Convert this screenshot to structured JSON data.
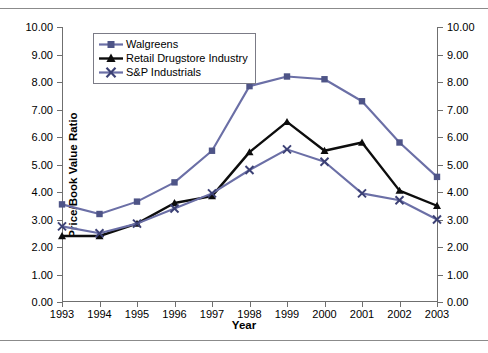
{
  "chart_data": {
    "type": "line",
    "title": "",
    "xlabel": "Year",
    "ylabel": "Price/Book Value Ratio",
    "categories": [
      "1993",
      "1994",
      "1995",
      "1996",
      "1997",
      "1998",
      "1999",
      "2000",
      "2001",
      "2002",
      "2003"
    ],
    "x": [
      1993,
      1994,
      1995,
      1996,
      1997,
      1998,
      1999,
      2000,
      2001,
      2002,
      2003
    ],
    "ylim": [
      0,
      10
    ],
    "ytick_step": 1,
    "ytick_labels": [
      "0.00",
      "1.00",
      "2.00",
      "3.00",
      "4.00",
      "5.00",
      "6.00",
      "7.00",
      "8.00",
      "9.00",
      "10.00"
    ],
    "right_axis_labels": [
      "0.00",
      "1.00",
      "2.00",
      "3.00",
      "4.00",
      "5.00",
      "6.00",
      "7.00",
      "8.00",
      "9.00",
      "10.00"
    ],
    "grid": false,
    "legend_position": "top-left",
    "series": [
      {
        "name": "Walgreens",
        "marker": "square",
        "color": "#6b6fa6",
        "values": [
          3.55,
          3.2,
          3.65,
          4.35,
          5.5,
          7.85,
          8.2,
          8.1,
          7.3,
          5.8,
          4.55
        ]
      },
      {
        "name": "Retail Drugstore Industry",
        "marker": "triangle",
        "color": "#0d0d0d",
        "values": [
          2.4,
          2.4,
          2.85,
          3.6,
          3.85,
          5.45,
          6.55,
          5.5,
          5.8,
          4.05,
          3.5
        ]
      },
      {
        "name": "S&P Industrials",
        "marker": "x",
        "color": "#6b6fa6",
        "values": [
          2.75,
          2.5,
          2.85,
          3.4,
          3.95,
          4.8,
          5.55,
          5.1,
          3.95,
          3.7,
          3.0
        ]
      }
    ]
  },
  "colors": {
    "walgreens": "#6b6fa6",
    "industry": "#0d0d0d",
    "sp": "#6b6fa6",
    "axis": "#6f6f6f",
    "rule": "#8b8b8b"
  }
}
